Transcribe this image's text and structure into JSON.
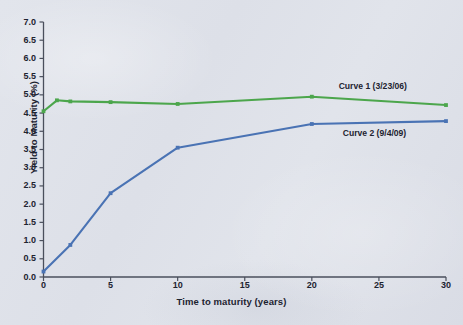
{
  "chart_data": {
    "type": "line",
    "title": "",
    "xlabel": "Time to maturity (years)",
    "ylabel": "Yield to Maturity (%)",
    "xlim": [
      0,
      30
    ],
    "ylim": [
      0.0,
      7.0
    ],
    "xticks": [
      "0",
      "5",
      "10",
      "15",
      "20",
      "25",
      "30"
    ],
    "yticks": [
      "0.0",
      "0.5",
      "1.0",
      "1.5",
      "2.0",
      "2.5",
      "3.0",
      "3.5",
      "4.0",
      "4.5",
      "5.0",
      "5.5",
      "6.0",
      "6.5",
      "7.0"
    ],
    "grid": false,
    "legend_position": "inline-right",
    "series": [
      {
        "name": "Curve 1 (3/23/06)",
        "color": "#4ca64c",
        "x": [
          0,
          1,
          2,
          5,
          10,
          20,
          30
        ],
        "values": [
          4.55,
          4.85,
          4.82,
          4.8,
          4.75,
          4.95,
          4.72
        ]
      },
      {
        "name": "Curve 2 (9/4/09)",
        "color": "#4a73b4",
        "x": [
          0,
          2,
          5,
          10,
          20,
          30
        ],
        "values": [
          0.15,
          0.88,
          2.3,
          3.55,
          4.2,
          4.28
        ]
      }
    ]
  },
  "axis": {
    "line_color": "#4a4f5c",
    "ylabel_text": "Yield to Maturity (%)",
    "xlabel_text": "Time to maturity (years)"
  },
  "labels": {
    "curve1": "Curve 1 (3/23/06)",
    "curve2": "Curve 2 (9/4/09)"
  }
}
